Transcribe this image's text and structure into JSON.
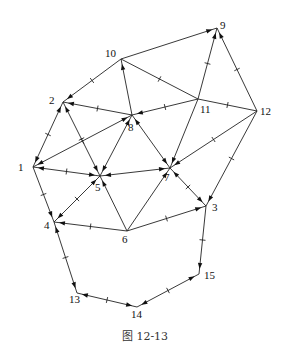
{
  "figure": {
    "caption": "图 12-13"
  },
  "graph": {
    "nodes": [
      {
        "id": "1",
        "x": 33,
        "y": 167,
        "lx": 18,
        "ly": 171
      },
      {
        "id": "2",
        "x": 63,
        "y": 102,
        "lx": 49,
        "ly": 104
      },
      {
        "id": "3",
        "x": 206,
        "y": 206,
        "lx": 212,
        "ly": 211
      },
      {
        "id": "4",
        "x": 54,
        "y": 222,
        "lx": 44,
        "ly": 229
      },
      {
        "id": "5",
        "x": 100,
        "y": 176,
        "lx": 95,
        "ly": 191
      },
      {
        "id": "6",
        "x": 127,
        "y": 231,
        "lx": 122,
        "ly": 243
      },
      {
        "id": "7",
        "x": 170,
        "y": 168,
        "lx": 164,
        "ly": 181
      },
      {
        "id": "8",
        "x": 132,
        "y": 115,
        "lx": 128,
        "ly": 131
      },
      {
        "id": "9",
        "x": 217,
        "y": 28,
        "lx": 220,
        "ly": 29
      },
      {
        "id": "10",
        "x": 121,
        "y": 59,
        "lx": 105,
        "ly": 57
      },
      {
        "id": "11",
        "x": 198,
        "y": 99,
        "lx": 200,
        "ly": 113
      },
      {
        "id": "12",
        "x": 257,
        "y": 111,
        "lx": 260,
        "ly": 115
      },
      {
        "id": "13",
        "x": 77,
        "y": 293,
        "lx": 69,
        "ly": 303
      },
      {
        "id": "14",
        "x": 137,
        "y": 307,
        "lx": 131,
        "ly": 318
      },
      {
        "id": "15",
        "x": 199,
        "y": 274,
        "lx": 204,
        "ly": 279
      }
    ],
    "edges": [
      {
        "from": "1",
        "to": "2",
        "tick": true,
        "arrows": [
          "start",
          "end"
        ]
      },
      {
        "from": "1",
        "to": "8",
        "tick": true,
        "arrows": [
          "start",
          "end"
        ]
      },
      {
        "from": "1",
        "to": "5",
        "tick": true,
        "arrows": [
          "start",
          "end"
        ]
      },
      {
        "from": "1",
        "to": "4",
        "tick": true,
        "arrows": [
          "end"
        ]
      },
      {
        "from": "2",
        "to": "10",
        "tick": true,
        "arrows": [
          "start"
        ]
      },
      {
        "from": "2",
        "to": "8",
        "tick": true,
        "arrows": [
          "start"
        ]
      },
      {
        "from": "2",
        "to": "5",
        "tick": true,
        "arrows": [
          "start",
          "end"
        ]
      },
      {
        "from": "10",
        "to": "9",
        "tick": false,
        "arrows": [
          "end"
        ]
      },
      {
        "from": "10",
        "to": "8",
        "tick": false,
        "arrows": [
          "start"
        ]
      },
      {
        "from": "10",
        "to": "11",
        "tick": true,
        "arrows": []
      },
      {
        "from": "8",
        "to": "11",
        "tick": true,
        "arrows": [
          "start"
        ]
      },
      {
        "from": "8",
        "to": "5",
        "tick": false,
        "arrows": [
          "start",
          "end"
        ]
      },
      {
        "from": "8",
        "to": "7",
        "tick": false,
        "arrows": [
          "start",
          "end"
        ]
      },
      {
        "from": "9",
        "to": "11",
        "tick": true,
        "arrows": [
          "start"
        ]
      },
      {
        "from": "9",
        "to": "12",
        "tick": true,
        "arrows": [
          "start"
        ]
      },
      {
        "from": "11",
        "to": "12",
        "tick": true,
        "arrows": []
      },
      {
        "from": "11",
        "to": "7",
        "tick": false,
        "arrows": [
          "end"
        ]
      },
      {
        "from": "12",
        "to": "7",
        "tick": true,
        "arrows": [
          "end"
        ]
      },
      {
        "from": "12",
        "to": "3",
        "tick": true,
        "arrows": [
          "end"
        ]
      },
      {
        "from": "5",
        "to": "7",
        "tick": false,
        "arrows": [
          "start",
          "end"
        ]
      },
      {
        "from": "5",
        "to": "4",
        "tick": true,
        "arrows": [
          "start",
          "end"
        ]
      },
      {
        "from": "5",
        "to": "6",
        "tick": false,
        "arrows": [
          "start"
        ]
      },
      {
        "from": "7",
        "to": "6",
        "tick": false,
        "arrows": [
          "start"
        ]
      },
      {
        "from": "7",
        "to": "3",
        "tick": true,
        "arrows": [
          "start",
          "end"
        ]
      },
      {
        "from": "4",
        "to": "6",
        "tick": true,
        "arrows": [
          "start"
        ]
      },
      {
        "from": "6",
        "to": "3",
        "tick": true,
        "arrows": [
          "end"
        ]
      },
      {
        "from": "4",
        "to": "13",
        "tick": true,
        "arrows": [
          "start",
          "end"
        ]
      },
      {
        "from": "13",
        "to": "14",
        "tick": true,
        "arrows": [
          "start",
          "end"
        ]
      },
      {
        "from": "14",
        "to": "15",
        "tick": true,
        "arrows": [
          "start",
          "end"
        ]
      },
      {
        "from": "15",
        "to": "3",
        "tick": true,
        "arrows": [
          "start"
        ]
      }
    ]
  }
}
